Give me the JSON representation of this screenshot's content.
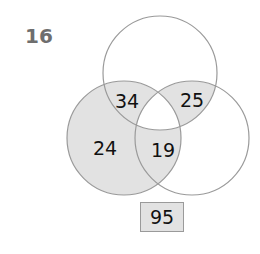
{
  "question_number": "16",
  "colors": {
    "shade": "#e2e2e2",
    "stroke": "#9a9a9a",
    "text": "#111111",
    "number_color": "#6e6e6e"
  },
  "venn": {
    "circles": [
      {
        "name": "top",
        "cx": 160,
        "cy": 73,
        "r": 57
      },
      {
        "name": "left",
        "cx": 124,
        "cy": 138,
        "r": 57
      },
      {
        "name": "right",
        "cx": 192,
        "cy": 138,
        "r": 57
      }
    ],
    "regions": {
      "left_only": "24",
      "top_left": "34",
      "top_right": "25",
      "left_right": "19"
    }
  },
  "answer": "95"
}
